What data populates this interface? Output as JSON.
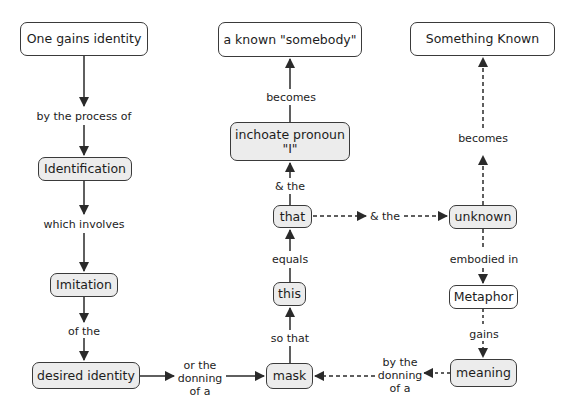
{
  "nodes": {
    "one_gains_identity": "One gains identity",
    "known_somebody": "a known \"somebody\"",
    "something_known": "Something Known",
    "identification": "Identification",
    "imitation": "Imitation",
    "desired_identity": "desired identity",
    "inchoate_pronoun": "inchoate pronoun\n\"I\"",
    "that": "that",
    "this": "this",
    "mask": "mask",
    "unknown": "unknown",
    "metaphor": "Metaphor",
    "meaning": "meaning"
  },
  "links": {
    "by_the_process_of": "by the process of",
    "which_involves": "which involves",
    "of_the": "of the",
    "or_the_donning_of_a": "or the\ndonning\nof a",
    "so_that": "so that",
    "equals": "equals",
    "and_the_up": "& the",
    "becomes_left": "becomes",
    "and_the_right": "& the",
    "becomes_right": "becomes",
    "embodied_in": "embodied in",
    "gains": "gains",
    "by_the_donning_of_a": "by the\ndonning\nof a"
  },
  "colors": {
    "line": "#2a2a2a",
    "node_border": "#3a3a3a",
    "node_fill_gray": "#ececec",
    "node_fill_white": "#ffffff"
  }
}
